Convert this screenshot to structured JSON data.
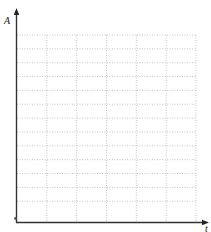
{
  "chart_data": {
    "type": "line",
    "title": "",
    "xlabel": "t",
    "ylabel": "A",
    "series": [],
    "x_ticks": [],
    "y_ticks": [],
    "grid": {
      "on": true,
      "style": "dotted",
      "columns": 6,
      "rows": 13,
      "color": "#b8b8b8"
    },
    "legend": null,
    "axis_color": "#333333"
  },
  "labels": {
    "y_axis": "A",
    "x_axis": "t"
  }
}
